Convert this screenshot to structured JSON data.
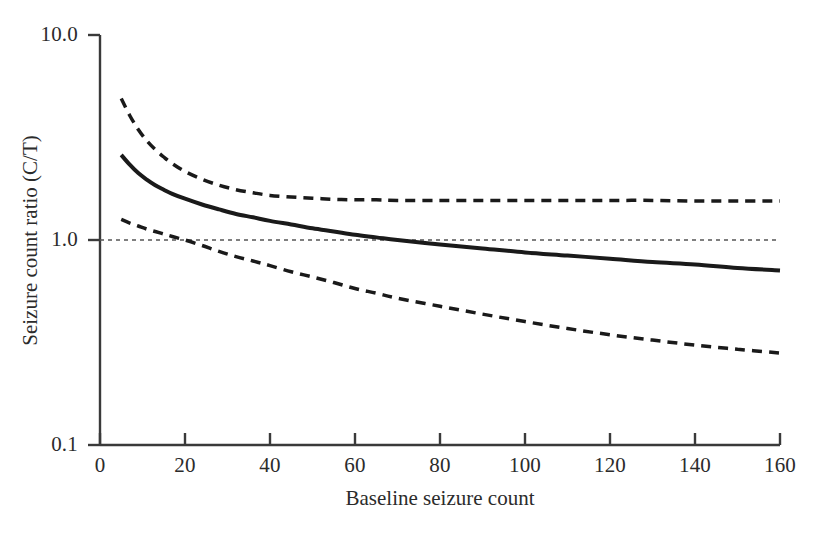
{
  "chart_data": {
    "type": "line",
    "title": "",
    "xlabel": "Baseline seizure count",
    "ylabel": "Seizure count ratio (C/T)",
    "xlim": [
      0,
      160
    ],
    "ylim": [
      0.1,
      10.0
    ],
    "yscale": "log",
    "xscale": "linear",
    "grid": false,
    "legend": "none",
    "xticks": [
      0,
      20,
      40,
      60,
      80,
      100,
      120,
      140,
      160
    ],
    "xtick_labels": [
      "0",
      "20",
      "40",
      "60",
      "80",
      "100",
      "120",
      "140",
      "160"
    ],
    "yticks": [
      0.1,
      1.0,
      10.0
    ],
    "ytick_labels": [
      "0.1",
      "1.0",
      "10.0"
    ],
    "series": [
      {
        "name": "Estimated seizure count ratio",
        "style": "solid",
        "color": "#1a1a1a",
        "linewidth": 4,
        "x": [
          5,
          7,
          9,
          11,
          13,
          15,
          17,
          20,
          24,
          28,
          32,
          36,
          40,
          45,
          50,
          55,
          60,
          65,
          70,
          80,
          90,
          100,
          110,
          120,
          130,
          140,
          150,
          160
        ],
        "y": [
          2.6,
          2.33,
          2.12,
          1.97,
          1.85,
          1.76,
          1.68,
          1.59,
          1.49,
          1.41,
          1.34,
          1.29,
          1.24,
          1.19,
          1.14,
          1.1,
          1.06,
          1.03,
          1.0,
          0.95,
          0.91,
          0.87,
          0.84,
          0.81,
          0.78,
          0.76,
          0.73,
          0.71
        ]
      },
      {
        "name": "Upper 95% confidence limit",
        "style": "dashed",
        "color": "#1a1a1a",
        "linewidth": 3.5,
        "x": [
          5,
          7,
          9,
          11,
          13,
          15,
          17,
          20,
          24,
          28,
          32,
          36,
          40,
          45,
          50,
          55,
          60,
          65,
          70,
          80,
          90,
          100,
          110,
          120,
          130,
          140,
          150,
          160
        ],
        "y": [
          4.9,
          4.05,
          3.46,
          3.05,
          2.76,
          2.54,
          2.36,
          2.16,
          1.98,
          1.85,
          1.76,
          1.7,
          1.65,
          1.62,
          1.6,
          1.58,
          1.57,
          1.57,
          1.56,
          1.56,
          1.56,
          1.56,
          1.56,
          1.56,
          1.56,
          1.55,
          1.55,
          1.55
        ]
      },
      {
        "name": "Lower 95% confidence limit",
        "style": "dashed",
        "color": "#1a1a1a",
        "linewidth": 3.5,
        "x": [
          5,
          7,
          9,
          11,
          13,
          15,
          17,
          20,
          24,
          28,
          32,
          36,
          40,
          45,
          50,
          55,
          60,
          65,
          70,
          80,
          90,
          100,
          110,
          120,
          130,
          140,
          150,
          160
        ],
        "y": [
          1.26,
          1.21,
          1.17,
          1.13,
          1.1,
          1.07,
          1.04,
          1.0,
          0.94,
          0.88,
          0.83,
          0.79,
          0.75,
          0.7,
          0.66,
          0.62,
          0.58,
          0.55,
          0.52,
          0.475,
          0.435,
          0.4,
          0.37,
          0.345,
          0.325,
          0.307,
          0.293,
          0.281
        ]
      }
    ],
    "reference_lines": [
      {
        "name": "null-ratio-reference",
        "orientation": "horizontal",
        "value": 1.0,
        "style": "dotted",
        "color": "#555555",
        "linewidth": 1.5
      }
    ],
    "annotations": []
  },
  "axes": {
    "x_title": "Baseline seizure count",
    "y_title": "Seizure count ratio (C/T)",
    "x_tick_labels": [
      "0",
      "20",
      "40",
      "60",
      "80",
      "100",
      "120",
      "140",
      "160"
    ],
    "y_tick_labels": [
      "10.0",
      "1.0",
      "0.1"
    ]
  },
  "colors": {
    "axis": "#3a3a3a",
    "curve": "#1a1a1a",
    "reference": "#555555",
    "text": "#2b2b2b",
    "background": "#ffffff"
  }
}
